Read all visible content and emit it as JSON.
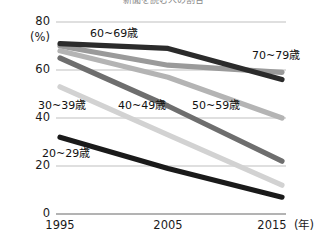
{
  "chart_data": {
    "type": "line",
    "title": "新聞を読む人の割合",
    "xlabel": "年",
    "ylabel": "(%)",
    "x": [
      "1995",
      "2005",
      "2015"
    ],
    "categories": [
      "1995",
      "2005",
      "2015"
    ],
    "ylim": [
      0,
      80
    ],
    "yticks": [
      0,
      20,
      40,
      60,
      80
    ],
    "ytick_labels": [
      "0",
      "20",
      "40",
      "60",
      "80"
    ],
    "xtick_labels": [
      "1995",
      "2005",
      "2015"
    ],
    "grid": true,
    "legend": "inline-labels",
    "series": [
      {
        "name": "20~29歳",
        "label": "20~29歳",
        "color": "#1a1a1a",
        "values": [
          32,
          19,
          7
        ]
      },
      {
        "name": "30~39歳",
        "label": "30~39歳",
        "color": "#d2d2d2",
        "values": [
          53,
          33,
          12
        ]
      },
      {
        "name": "40~49歳",
        "label": "40~49歳",
        "color": "#6e6e6e",
        "values": [
          65,
          45,
          22
        ]
      },
      {
        "name": "50~59歳",
        "label": "50~59歳",
        "color": "#b4b4b4",
        "values": [
          68,
          57,
          40
        ]
      },
      {
        "name": "60~69歳",
        "label": "60~69歳",
        "color": "#2b2b2b",
        "values": [
          71,
          69,
          56
        ]
      },
      {
        "name": "70~79歳",
        "label": "70~79歳",
        "color": "#9a9a9a",
        "values": [
          70,
          62,
          59
        ]
      }
    ]
  },
  "axis": {
    "y_unit": "(%)",
    "y_80": "80",
    "y_60": "60",
    "y_40": "40",
    "y_20": "20",
    "y_0": "0",
    "x_1995": "1995",
    "x_2005": "2005",
    "x_2015": "2015",
    "x_unit": "(年)"
  },
  "labels": {
    "s20": "20~29歳",
    "s30": "30~39歳",
    "s40": "40~49歳",
    "s50": "50~59歳",
    "s60": "60~69歳",
    "s70": "70~79歳"
  }
}
